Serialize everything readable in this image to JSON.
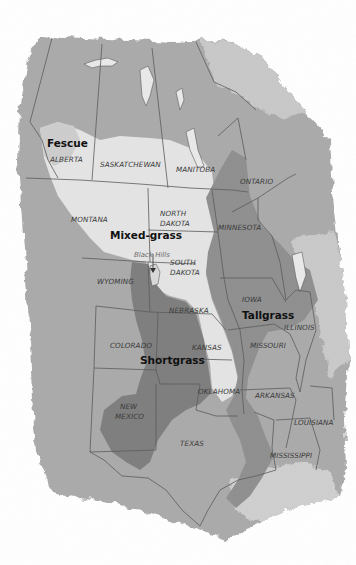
{
  "map": {
    "colors": {
      "background": "#ffffff",
      "land_base": "#a9a9a9",
      "land_light": "#c4c4c4",
      "fescue_mixed": "#e3e3e3",
      "tallgrass": "#8e8e8e",
      "shortgrass": "#7d7d7d",
      "water": "#e6e6e6",
      "border": "#5c5c5c"
    },
    "regions": [
      {
        "id": "fescue",
        "label": "Fescue"
      },
      {
        "id": "mixed-grass",
        "label": "Mixed-grass"
      },
      {
        "id": "tallgrass",
        "label": "Tallgrass"
      },
      {
        "id": "shortgrass",
        "label": "Shortgrass"
      }
    ],
    "states": [
      {
        "name": "ALBERTA"
      },
      {
        "name": "SASKATCHEWAN"
      },
      {
        "name": "MANITOBA"
      },
      {
        "name": "ONTARIO"
      },
      {
        "name": "MONTANA"
      },
      {
        "name": "NORTH"
      },
      {
        "name": "DAKOTA"
      },
      {
        "name": "MINNESOTA"
      },
      {
        "name": "SOUTH"
      },
      {
        "name": "DAKOTA"
      },
      {
        "name": "WYOMING"
      },
      {
        "name": "IOWA"
      },
      {
        "name": "NEBRASKA"
      },
      {
        "name": "ILLINOIS"
      },
      {
        "name": "COLORADO"
      },
      {
        "name": "KANSAS"
      },
      {
        "name": "MISSOURI"
      },
      {
        "name": "OKLAHOMA"
      },
      {
        "name": "ARKANSAS"
      },
      {
        "name": "NEW"
      },
      {
        "name": "MEXICO"
      },
      {
        "name": "LOUISIANA"
      },
      {
        "name": "TEXAS"
      },
      {
        "name": "MISSISSIPPI"
      }
    ],
    "annotations": [
      {
        "label": "Black Hills"
      }
    ]
  }
}
